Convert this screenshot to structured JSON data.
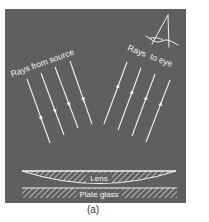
{
  "figure": {
    "caption": "(a)",
    "panel_color": "#5f5f5f",
    "line_color": "#f2f2f2",
    "logo": "A",
    "labels": {
      "incoming": "Rays from source",
      "outgoing": "Rays  to eye",
      "lens": "Lens",
      "plate": "Plate glass"
    },
    "incoming_rays": [
      {
        "x1": 27,
        "y1": 79,
        "x2": 50,
        "y2": 143
      },
      {
        "x1": 41,
        "y1": 73,
        "x2": 64,
        "y2": 135
      },
      {
        "x1": 55,
        "y1": 67,
        "x2": 78,
        "y2": 128
      },
      {
        "x1": 70,
        "y1": 61,
        "x2": 92,
        "y2": 124
      }
    ],
    "outgoing_rays": [
      {
        "x1": 104,
        "y1": 124,
        "x2": 127,
        "y2": 62
      },
      {
        "x1": 118,
        "y1": 130,
        "x2": 141,
        "y2": 68
      },
      {
        "x1": 132,
        "y1": 136,
        "x2": 155,
        "y2": 74
      },
      {
        "x1": 146,
        "y1": 142,
        "x2": 170,
        "y2": 80
      }
    ]
  }
}
